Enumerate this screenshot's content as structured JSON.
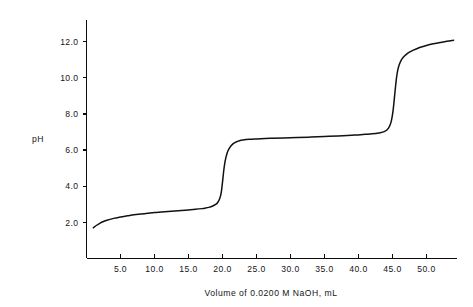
{
  "chart_data": {
    "type": "line",
    "title": "",
    "subtitle": "",
    "xlabel": "Volume of 0.0200 M NaOH, mL",
    "ylabel": "pH",
    "xlim": [
      0,
      54.5
    ],
    "ylim": [
      0,
      13.2
    ],
    "grid": false,
    "legend": null,
    "xticks": [
      5.0,
      10.0,
      15.0,
      20.0,
      25.0,
      30.0,
      35.0,
      40.0,
      45.0,
      50.0
    ],
    "xticklabels": [
      "5.0",
      "10.0",
      "15.0",
      "20.0",
      "25.0",
      "30.0",
      "35.0",
      "40.0",
      "45.0",
      "50.0"
    ],
    "yticks": [
      2.0,
      4.0,
      6.0,
      8.0,
      10.0,
      12.0
    ],
    "yticklabels": [
      "2.0",
      "4.0",
      "6.0",
      "8.0",
      "10.0",
      "12.0"
    ],
    "line_color": "#111111",
    "annotations": [],
    "series": [
      {
        "name": "titration curve",
        "x": [
          1.0,
          1.5,
          2.0,
          2.5,
          3.0,
          4.0,
          5.0,
          6.0,
          7.0,
          8.0,
          9.0,
          10.0,
          11.0,
          12.0,
          13.0,
          14.0,
          15.0,
          16.0,
          17.0,
          17.5,
          18.0,
          18.5,
          19.0,
          19.3,
          19.6,
          19.8,
          20.0,
          20.2,
          20.4,
          20.7,
          21.0,
          21.5,
          22.0,
          22.5,
          23.0,
          24.0,
          25.0,
          27.0,
          29.0,
          31.0,
          33.0,
          35.0,
          37.0,
          39.0,
          40.0,
          41.0,
          42.0,
          43.0,
          43.8,
          44.4,
          44.8,
          45.1,
          45.4,
          45.6,
          45.8,
          46.0,
          46.3,
          46.6,
          47.0,
          47.5,
          48.0,
          49.0,
          50.0,
          51.0,
          52.0,
          53.0,
          54.0
        ],
        "y": [
          1.7,
          1.84,
          1.96,
          2.05,
          2.12,
          2.22,
          2.3,
          2.36,
          2.42,
          2.46,
          2.5,
          2.54,
          2.57,
          2.6,
          2.63,
          2.66,
          2.69,
          2.72,
          2.76,
          2.79,
          2.83,
          2.89,
          2.99,
          3.1,
          3.32,
          3.6,
          4.2,
          4.9,
          5.4,
          5.85,
          6.1,
          6.33,
          6.45,
          6.52,
          6.56,
          6.6,
          6.62,
          6.65,
          6.67,
          6.7,
          6.72,
          6.75,
          6.78,
          6.82,
          6.84,
          6.87,
          6.9,
          6.95,
          7.02,
          7.2,
          7.55,
          8.2,
          9.3,
          10.0,
          10.45,
          10.72,
          10.98,
          11.14,
          11.28,
          11.42,
          11.52,
          11.68,
          11.79,
          11.88,
          11.95,
          12.02,
          12.08
        ]
      }
    ]
  },
  "axis_label_x": "Volume of 0.0200 M NaOH, mL",
  "axis_label_y": "pH"
}
